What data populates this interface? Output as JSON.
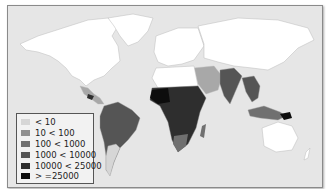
{
  "map": {
    "type": "choropleth",
    "style": "grayscale world map"
  },
  "legend": {
    "items": [
      {
        "label": "< 10",
        "color": "#d6d6d6"
      },
      {
        "label": "10 < 100",
        "color": "#8f8f8f"
      },
      {
        "label": "100 < 1000",
        "color": "#707070"
      },
      {
        "label": "1000 < 10000",
        "color": "#555555"
      },
      {
        "label": "10000 < 25000",
        "color": "#2e2e2e"
      },
      {
        "label": "> =25000",
        "color": "#0d0d0d"
      }
    ]
  },
  "colors": {
    "ocean": "#e6e6e6",
    "no_data": "#ffffff",
    "border": "#8a8a8a"
  }
}
